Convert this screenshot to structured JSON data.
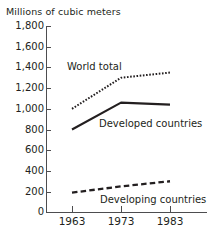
{
  "chart_data": {
    "type": "line",
    "title": "",
    "ylabel": "Millions of cubic meters",
    "xlabel": "",
    "x": [
      1963,
      1973,
      1983
    ],
    "xtick_labels": [
      "1963",
      "1973",
      "1983"
    ],
    "ylim": [
      0,
      1800
    ],
    "ytick_values": [
      0,
      200,
      400,
      600,
      800,
      1000,
      1200,
      1400,
      1600,
      1800
    ],
    "ytick_labels": [
      "0",
      "200",
      "400",
      "600",
      "800",
      "1,000",
      "1,200",
      "1,400",
      "1,600",
      "1,800"
    ],
    "grid": false,
    "legend": "inline-annotations",
    "series": [
      {
        "name": "World total",
        "label": "World total",
        "style": "dotted",
        "color": "#231f20",
        "values": [
          1000,
          1300,
          1350
        ]
      },
      {
        "name": "Developed countries",
        "label": "Developed countries",
        "style": "solid",
        "color": "#231f20",
        "values": [
          800,
          1060,
          1040
        ]
      },
      {
        "name": "Developing countries",
        "label": "Developing countries",
        "style": "dashed",
        "color": "#231f20",
        "values": [
          190,
          250,
          300
        ]
      }
    ]
  },
  "axis": {
    "y_caption": "Millions of cubic meters",
    "y_ticks": [
      "1,800",
      "1,600",
      "1,400",
      "1,200",
      "1,000",
      "800",
      "600",
      "400",
      "200",
      "0"
    ],
    "x_ticks": [
      "1963",
      "1973",
      "1983"
    ]
  },
  "annotations": {
    "world_total": "World total",
    "developed_countries": "Developed countries",
    "developing_countries": "Developing countries"
  },
  "colors": {
    "ink": "#231f20",
    "axis": "#4d4d4f",
    "background": "#ffffff"
  }
}
